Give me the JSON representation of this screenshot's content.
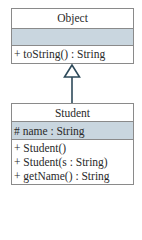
{
  "diagram": {
    "type": "uml-class-inheritance",
    "colors": {
      "border": "#8a8a8a",
      "attribute_band": "#c9d6df",
      "arrow": "#2e4a5a",
      "text": "#2a2a2a"
    },
    "classes": [
      {
        "name": "Object",
        "attributes": [],
        "methods": [
          "+ toString() : String"
        ]
      },
      {
        "name": "Student",
        "attributes": [
          "# name : String"
        ],
        "methods": [
          "+ Student()",
          "+ Student(s : String)",
          "+ getName() : String"
        ]
      }
    ],
    "relationships": [
      {
        "type": "generalization",
        "from": "Student",
        "to": "Object"
      }
    ]
  }
}
